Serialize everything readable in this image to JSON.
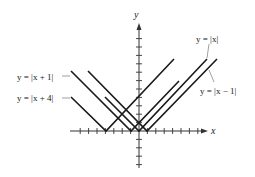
{
  "chart_data": {
    "type": "line",
    "title": "",
    "xlabel": "x",
    "ylabel": "y",
    "xlim": [
      -8,
      8
    ],
    "ylim": [
      -4,
      13
    ],
    "grid": false,
    "tick_spacing": 1,
    "series": [
      {
        "name": "y = |x + 4|",
        "vertex": [
          -4,
          0
        ],
        "points": [
          [
            -8,
            4
          ],
          [
            -4,
            0
          ],
          [
            4,
            8.5
          ]
        ]
      },
      {
        "name": "y = |x + 1|",
        "vertex": [
          -1,
          0
        ],
        "points": [
          [
            -8,
            7
          ],
          [
            -1,
            0
          ],
          [
            5,
            6
          ]
        ]
      },
      {
        "name": "y = |x|",
        "vertex": [
          0,
          0
        ],
        "points": [
          [
            -4,
            4
          ],
          [
            0,
            0
          ],
          [
            8.5,
            8.5
          ]
        ]
      },
      {
        "name": "y = |x − 1|",
        "vertex": [
          1,
          0
        ],
        "points": [
          [
            -6,
            7
          ],
          [
            1,
            0
          ],
          [
            9.5,
            8.5
          ]
        ]
      }
    ],
    "annotations": [
      {
        "text": "y = |x|",
        "points_to": "y = |x|",
        "position": "upper-right"
      },
      {
        "text": "y = |x − 1|",
        "points_to": "y = |x − 1|",
        "position": "right"
      },
      {
        "text": "y = |x + 1|",
        "points_to": "y = |x + 1|",
        "position": "left"
      },
      {
        "text": "y = |x + 4|",
        "points_to": "y = |x + 4|",
        "position": "left"
      }
    ]
  },
  "labels": {
    "x_axis": "x",
    "y_axis": "y",
    "abs_x": "y = |x|",
    "abs_x_minus_1": "y = |x − 1|",
    "abs_x_plus_1": "y = |x + 1|",
    "abs_x_plus_4": "y = |x + 4|"
  },
  "colors": {
    "line": "#1a1a1a",
    "axis": "#333333",
    "leader": "#777777"
  }
}
